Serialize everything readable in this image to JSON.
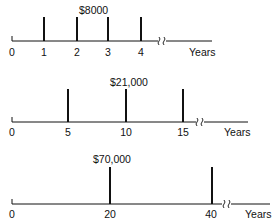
{
  "timelines": [
    {
      "amount_label": "$8000",
      "unit_label": "Years",
      "origin_label": "0",
      "payments_at": [
        1,
        2,
        3,
        4
      ],
      "tick_labels": [
        "1",
        "2",
        "3",
        "4"
      ],
      "has_break": true
    },
    {
      "amount_label": "$21,000",
      "unit_label": "Years",
      "origin_label": "0",
      "payments_at": [
        5,
        10,
        15
      ],
      "tick_labels": [
        "5",
        "10",
        "15"
      ],
      "has_break": true
    },
    {
      "amount_label": "$70,000",
      "unit_label": "Years",
      "origin_label": "0",
      "payments_at": [
        20,
        40
      ],
      "tick_labels": [
        "20",
        "40"
      ],
      "has_break": true
    }
  ]
}
